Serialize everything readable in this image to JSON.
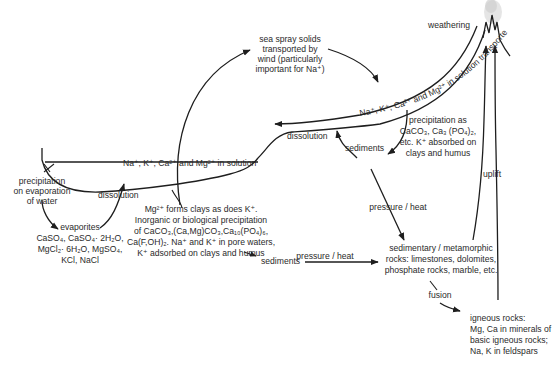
{
  "labels": {
    "weathering": "weathering",
    "rivers": "Na⁺, K⁺, Ca²⁺ and Mg²⁺ in solution transported in rivers",
    "sea_spray": [
      "sea spray solids",
      "transported by",
      "wind (particularly",
      "important for Na⁺)"
    ],
    "ocean_solution": "Na⁺, K⁺, Ca²⁺ and Mg²⁺ in solution",
    "dissolution_upper": "dissolution",
    "dissolution_lower": "dissolution",
    "sediments_upper": "sediments",
    "sediments_lower": "sediments",
    "river_precipitation": [
      "precipitation as",
      "CaCO₃, Ca₃ (PO₄)₂,",
      "etc. K⁺ absorbed on",
      "clays and humus"
    ],
    "uplift": "uplift",
    "evaporation": [
      "precipitation",
      "on evaporation",
      "of water"
    ],
    "evaporites_title": "evaporites",
    "evaporites": [
      "CaSO₄, CaSO₄· 2H₂O,",
      "MgCl₂· 6H₂O, MgSO₄,",
      "KCl, NaCl"
    ],
    "ocean_precipitation": [
      "Mg²⁺ forms clays as does K⁺.",
      "Inorganic or biological precipitation",
      "of CaCO₃,(Ca,Mg)CO₃,Ca₁₀(PO₄)₆,",
      "Ca(F,OH)₂. Na⁺ and K⁺ in pore waters,",
      "K⁺ adsorbed on clays and humus"
    ],
    "pressure_heat_upper": "pressure / heat",
    "pressure_heat_lower": "pressure / heat",
    "sedimentary_rocks": [
      "sedimentary / metamorphic",
      "rocks: limestones, dolomites,",
      "phosphate rocks, marble, etc."
    ],
    "fusion": "fusion",
    "igneous_rocks": [
      "igneous rocks:",
      "Mg, Ca in minerals of",
      "basic igneous rocks;",
      "Na, K in feldspars"
    ]
  },
  "icons": {
    "mountain": "mountain-peaks-icon",
    "arrow": "arrowhead-icon"
  },
  "colors": {
    "line": "#1e1e1e",
    "text": "#2a2a2a",
    "background": "#ffffff",
    "haze": "#cfcfcf"
  }
}
